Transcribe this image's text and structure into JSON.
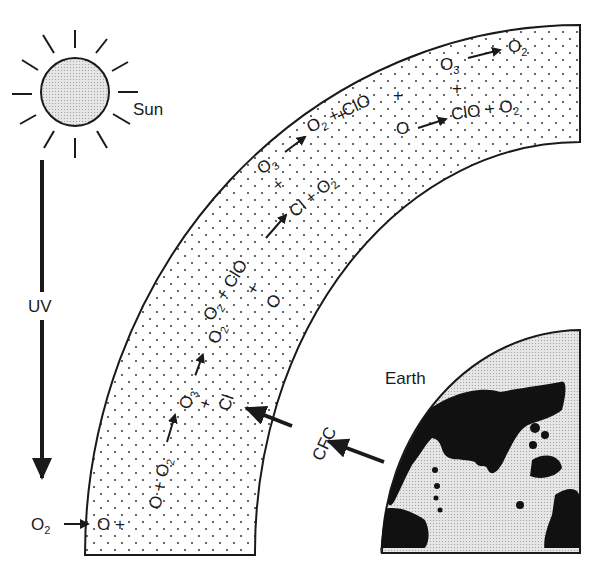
{
  "labels": {
    "sun": "Sun",
    "uv": "UV",
    "earth": "Earth",
    "cfc": "CFC",
    "o2_start": "O",
    "o2_start_sub": "2"
  },
  "reactions": [
    {
      "id": "r1",
      "text": "O + O₂ → O₃"
    },
    {
      "id": "r2",
      "text": "O₃ → O₂ + ClO"
    },
    {
      "id": "r3",
      "text": "Cl + O₃ → O₂ + ClO"
    },
    {
      "id": "r4",
      "text": "ClO + O → Cl + O₂"
    },
    {
      "id": "r5",
      "text": "O₃ → O₂ + ClO"
    },
    {
      "id": "r6",
      "text": "O + ... → ClO + O₂"
    },
    {
      "id": "r7",
      "text": "O₃ → O₂"
    }
  ],
  "chain": {
    "step1": {
      "a": "O +",
      "b": "O + O₂",
      "arrow_to": "O₃",
      "plus": "+",
      "cl": "Cl"
    },
    "step2": {
      "o3": "O₃",
      "to": "O₂ + ClO",
      "plus": "+",
      "o": "O"
    },
    "step3": {
      "clo_to": "Cl + O₂",
      "o3": "O₃",
      "plus": "+",
      "to": "O₂ + ClO"
    },
    "step4": {
      "plus": "+",
      "o": "O",
      "to": "ClO + O₂"
    },
    "step5": {
      "o3": "O₃",
      "to": "O₂",
      "plus": "+"
    }
  },
  "colors": {
    "ink": "#1a1a1a",
    "sun_fill": "#d9d9d9",
    "earth_fill": "#e0e0e0",
    "land": "#111111",
    "band_dots": "#333333",
    "background": "#ffffff"
  }
}
